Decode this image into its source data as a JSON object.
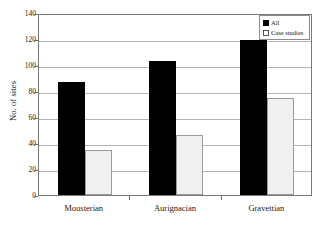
{
  "chart_data": {
    "type": "bar",
    "title": "",
    "subtitle": "",
    "xlabel": "",
    "ylabel": "No. of sites",
    "categories": [
      "Mousterian",
      "Aurignacian",
      "Gravettian"
    ],
    "series": [
      {
        "name": "All",
        "values": [
          87,
          103,
          119
        ],
        "color": "#000000"
      },
      {
        "name": "Case studies",
        "values": [
          35,
          46,
          75
        ],
        "color": "#f0f0f0"
      }
    ],
    "ylim": [
      0,
      140
    ],
    "ytick_step": 20,
    "yticks": [
      0,
      20,
      40,
      60,
      80,
      100,
      120,
      140
    ],
    "ytick_labels": [
      "0",
      "20",
      "40",
      "60",
      "80",
      "100",
      "120",
      "140"
    ],
    "grid": true,
    "grid_axis": "y",
    "legend_position": "top-right",
    "legend_entries": [
      {
        "label": "All",
        "swatch": "filled"
      },
      {
        "label": "Case studies",
        "swatch": "hollow"
      }
    ],
    "frame_color": "#7a7a7a",
    "grid_color": "#b4b4b4",
    "bar_edge_color": "#9a9a9a",
    "background": "#ffffff"
  }
}
